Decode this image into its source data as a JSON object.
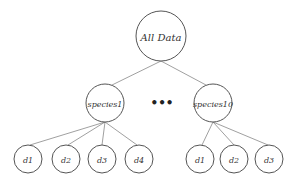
{
  "diagram": {
    "type": "tree",
    "root": {
      "label": "All Data"
    },
    "ellipsis": "•••",
    "children": [
      {
        "label": "species1",
        "children": [
          "d1",
          "d2",
          "d3",
          "d4"
        ]
      },
      {
        "label": "species10",
        "children": [
          "d1",
          "d2",
          "d3"
        ]
      }
    ]
  },
  "colors": {
    "stroke": "#555555",
    "edge": "#888888",
    "text": "#333333"
  }
}
